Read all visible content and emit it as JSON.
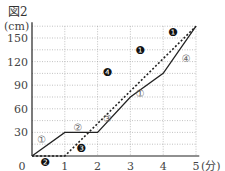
{
  "figure_label": "図2",
  "chart_data": {
    "type": "line",
    "title": "図2",
    "xlabel": "(分)",
    "ylabel": "(cm)",
    "xlim": [
      0,
      5
    ],
    "ylim": [
      0,
      165
    ],
    "x_ticks": [
      "0",
      "1",
      "2",
      "3",
      "4",
      "5"
    ],
    "y_ticks": [
      "30",
      "60",
      "90",
      "120",
      "150"
    ],
    "grid": true,
    "series": [
      {
        "name": "solid",
        "style": "solid",
        "points": [
          [
            0,
            0
          ],
          [
            1,
            30
          ],
          [
            2,
            30
          ],
          [
            3,
            75
          ],
          [
            4,
            105
          ],
          [
            5,
            165
          ]
        ]
      },
      {
        "name": "dashed",
        "style": "dashed",
        "points": [
          [
            0,
            0
          ],
          [
            1,
            0
          ],
          [
            5,
            165
          ]
        ]
      }
    ],
    "annotations": [
      {
        "text": "①",
        "x": 0.3,
        "y": 22,
        "style": "outline"
      },
      {
        "text": "②",
        "x": 1.4,
        "y": 37,
        "style": "outline"
      },
      {
        "text": "③",
        "x": 2.3,
        "y": 48,
        "style": "outline"
      },
      {
        "text": "①",
        "x": 3.3,
        "y": 80,
        "style": "outline"
      },
      {
        "text": "④",
        "x": 4.7,
        "y": 125,
        "style": "outline"
      },
      {
        "text": "❷",
        "x": 0.4,
        "y": -7,
        "style": "filled"
      },
      {
        "text": "❸",
        "x": 1.5,
        "y": 10,
        "style": "filled"
      },
      {
        "text": "❹",
        "x": 2.3,
        "y": 107,
        "style": "filled"
      },
      {
        "text": "❶",
        "x": 3.3,
        "y": 135,
        "style": "filled"
      },
      {
        "text": "❶",
        "x": 4.3,
        "y": 157,
        "style": "filled"
      }
    ]
  }
}
